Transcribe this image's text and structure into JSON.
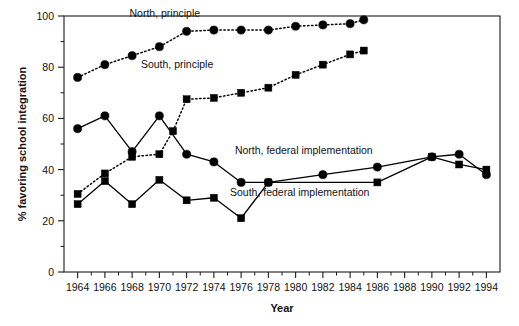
{
  "chart_data": {
    "type": "line",
    "title": "",
    "xlabel": "Year",
    "ylabel": "% favoring school integration",
    "xlim": [
      1963,
      1995
    ],
    "ylim": [
      0,
      100
    ],
    "grid": false,
    "legend_position": "inline-annotations",
    "x_ticks": [
      1964,
      1966,
      1968,
      1970,
      1972,
      1974,
      1976,
      1978,
      1980,
      1982,
      1984,
      1986,
      1988,
      1990,
      1992,
      1994
    ],
    "x_tick_labels": [
      "1964",
      "1966",
      "1968",
      "1970",
      "1972",
      "1974",
      "1976",
      "1978",
      "1980",
      "1982",
      "1984",
      "1986",
      "1988",
      "1990",
      "1992",
      "1994"
    ],
    "x_minor_ticks": [
      1965,
      1967,
      1969,
      1971,
      1973,
      1975,
      1977,
      1979,
      1981,
      1983,
      1985,
      1987,
      1989,
      1991,
      1993
    ],
    "y_ticks": [
      0,
      20,
      40,
      60,
      80,
      100
    ],
    "y_tick_labels": [
      "0",
      "20",
      "40",
      "60",
      "80",
      "100"
    ],
    "y_minor_ticks": [
      10,
      30,
      50,
      70,
      90
    ],
    "series": [
      {
        "name": "North, principle",
        "marker": "circle",
        "line_style": "dotted",
        "color": "#000000",
        "label_x": 1970.4,
        "label_y": 99.5,
        "points": [
          {
            "x": 1964,
            "y": 76
          },
          {
            "x": 1966,
            "y": 81
          },
          {
            "x": 1968,
            "y": 84.5
          },
          {
            "x": 1970,
            "y": 88
          },
          {
            "x": 1972,
            "y": 94
          },
          {
            "x": 1974,
            "y": 94.5
          },
          {
            "x": 1976,
            "y": 94.5
          },
          {
            "x": 1978,
            "y": 94.5
          },
          {
            "x": 1980,
            "y": 96
          },
          {
            "x": 1982,
            "y": 96.5
          },
          {
            "x": 1984,
            "y": 97
          },
          {
            "x": 1985,
            "y": 98.5
          }
        ]
      },
      {
        "name": "South, principle",
        "marker": "square",
        "line_style": "dotted",
        "color": "#000000",
        "label_x": 1971.3,
        "label_y": 79.5,
        "points": [
          {
            "x": 1964,
            "y": 30.5
          },
          {
            "x": 1966,
            "y": 38.5
          },
          {
            "x": 1968,
            "y": 45
          },
          {
            "x": 1970,
            "y": 46
          },
          {
            "x": 1971,
            "y": 55
          },
          {
            "x": 1972,
            "y": 67.5
          },
          {
            "x": 1974,
            "y": 68
          },
          {
            "x": 1976,
            "y": 70
          },
          {
            "x": 1978,
            "y": 72
          },
          {
            "x": 1980,
            "y": 77
          },
          {
            "x": 1982,
            "y": 81
          },
          {
            "x": 1984,
            "y": 85
          },
          {
            "x": 1985,
            "y": 86.5
          }
        ]
      },
      {
        "name": "North, federal implementation",
        "marker": "circle",
        "line_style": "solid",
        "color": "#000000",
        "label_x": 1980.6,
        "label_y": 46,
        "points": [
          {
            "x": 1964,
            "y": 56
          },
          {
            "x": 1966,
            "y": 61
          },
          {
            "x": 1968,
            "y": 47
          },
          {
            "x": 1970,
            "y": 61
          },
          {
            "x": 1972,
            "y": 46
          },
          {
            "x": 1974,
            "y": 43
          },
          {
            "x": 1976,
            "y": 35
          },
          {
            "x": 1978,
            "y": 35
          },
          {
            "x": 1982,
            "y": 38
          },
          {
            "x": 1986,
            "y": 41
          },
          {
            "x": 1990,
            "y": 45
          },
          {
            "x": 1992,
            "y": 46
          },
          {
            "x": 1994,
            "y": 38
          }
        ]
      },
      {
        "name": "South, federal implementation",
        "marker": "square",
        "line_style": "solid",
        "color": "#000000",
        "label_x": 1980.3,
        "label_y": 29.5,
        "points": [
          {
            "x": 1964,
            "y": 26.5
          },
          {
            "x": 1966,
            "y": 35.5
          },
          {
            "x": 1968,
            "y": 26.5
          },
          {
            "x": 1970,
            "y": 36
          },
          {
            "x": 1972,
            "y": 28
          },
          {
            "x": 1974,
            "y": 29
          },
          {
            "x": 1976,
            "y": 21
          },
          {
            "x": 1978,
            "y": 35
          },
          {
            "x": 1986,
            "y": 35
          },
          {
            "x": 1990,
            "y": 45
          },
          {
            "x": 1992,
            "y": 42
          },
          {
            "x": 1994,
            "y": 40
          }
        ]
      }
    ]
  },
  "axes": {
    "x_title": "Year",
    "y_title": "% favoring school integration"
  }
}
